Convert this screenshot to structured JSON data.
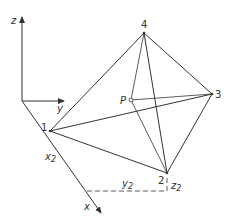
{
  "diagram": {
    "type": "tetrahedron-coordinate-sketch",
    "axes": {
      "z_label": "z",
      "y_label": "y",
      "x_label": "x",
      "origin": [
        22,
        101
      ],
      "z_end": [
        22,
        17
      ],
      "y_end": [
        64,
        101
      ],
      "x_end": [
        101,
        213
      ]
    },
    "vertices": [
      {
        "id": "1",
        "label": "1",
        "pos": [
          50,
          131
        ]
      },
      {
        "id": "2",
        "label": "2",
        "pos": [
          167,
          173
        ]
      },
      {
        "id": "3",
        "label": "3",
        "pos": [
          212,
          94
        ]
      },
      {
        "id": "4",
        "label": "4",
        "pos": [
          144,
          33
        ]
      }
    ],
    "point_p": {
      "label": "P",
      "pos": [
        131,
        100
      ]
    },
    "edges": [
      [
        "1",
        "4"
      ],
      [
        "4",
        "3"
      ],
      [
        "3",
        "2"
      ],
      [
        "2",
        "1"
      ],
      [
        "4",
        "2"
      ],
      [
        "1",
        "3"
      ]
    ],
    "p_connections": [
      [
        "P",
        "4"
      ],
      [
        "P",
        "3"
      ],
      [
        "P",
        "2"
      ]
    ],
    "dimension_labels": {
      "x2": "x",
      "x2_sub": "2",
      "y2": "y",
      "y2_sub": "2",
      "z2": "z",
      "z2_sub": "2"
    },
    "colors": {
      "line": "#333333",
      "background": "#ffffff"
    }
  }
}
